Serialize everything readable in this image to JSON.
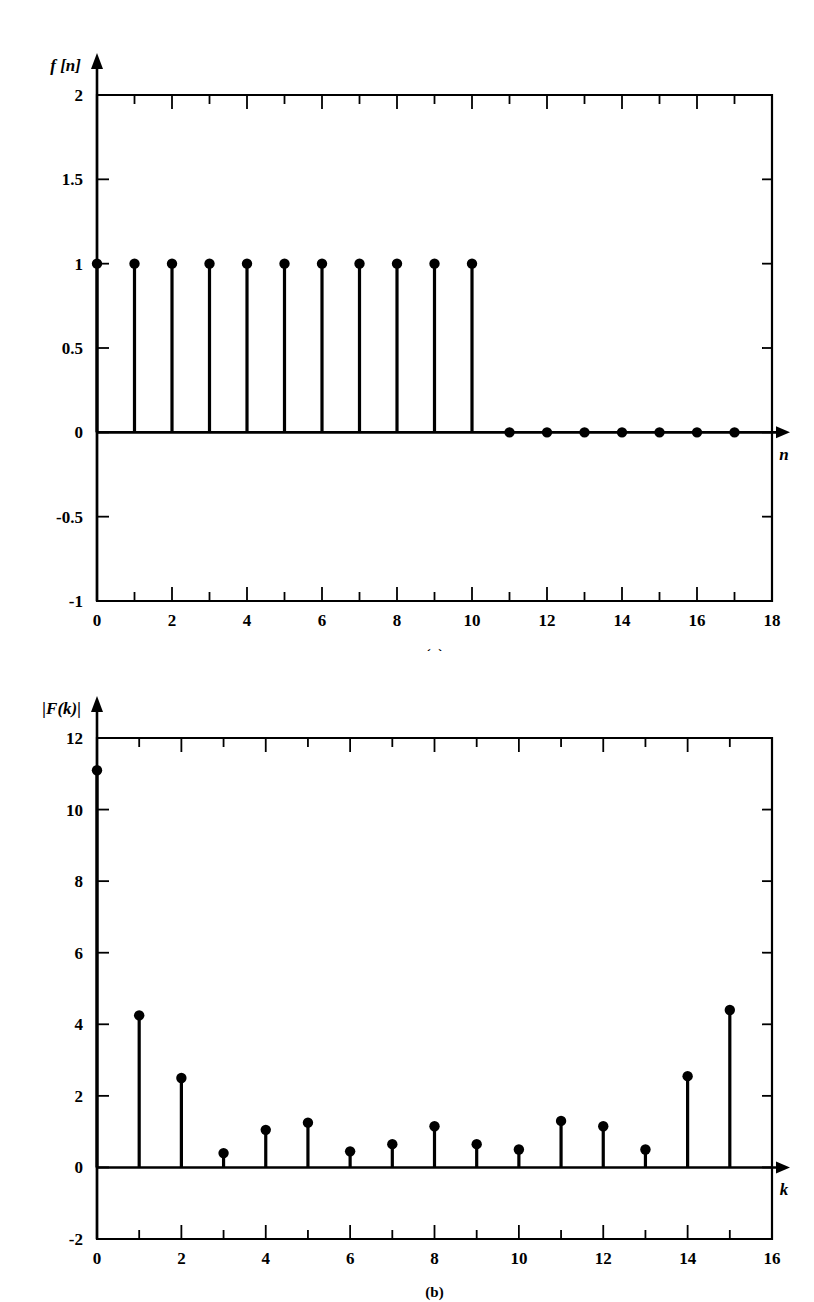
{
  "figure": {
    "background_color": "#ffffff",
    "ink_color": "#000000"
  },
  "panels": [
    {
      "id": "a",
      "caption": "(a)",
      "y_axis_label": "f [n]",
      "x_axis_label": "n"
    },
    {
      "id": "b",
      "caption": "(b)",
      "y_axis_label": "|F(k)|",
      "x_axis_label": "k"
    }
  ],
  "chart_data": [
    {
      "type": "scatter",
      "subtype": "stem",
      "panel": "a",
      "title": "",
      "xlabel": "n",
      "ylabel": "f [n]",
      "xlim": [
        0,
        18
      ],
      "ylim": [
        -1,
        2
      ],
      "grid": false,
      "legend": "none",
      "xticks": [
        0,
        2,
        4,
        6,
        8,
        10,
        12,
        14,
        16,
        18
      ],
      "xticklabels": [
        "0",
        "2",
        "4",
        "6",
        "8",
        "10",
        "12",
        "14",
        "16",
        "18"
      ],
      "xminorticks": [
        1,
        3,
        5,
        7,
        9,
        11,
        13,
        15,
        17
      ],
      "yticks": [
        -1,
        -0.5,
        0,
        0.5,
        1,
        1.5,
        2
      ],
      "yticklabels": [
        "-1",
        "-0.5",
        "0",
        "0.5",
        "1",
        "1.5",
        "2"
      ],
      "x": [
        0,
        1,
        2,
        3,
        4,
        5,
        6,
        7,
        8,
        9,
        10,
        11,
        12,
        13,
        14,
        15,
        16,
        17
      ],
      "values": [
        1,
        1,
        1,
        1,
        1,
        1,
        1,
        1,
        1,
        1,
        1,
        0,
        0,
        0,
        0,
        0,
        0,
        0
      ],
      "marker": "filled-circle",
      "baseline": 0
    },
    {
      "type": "scatter",
      "subtype": "stem",
      "panel": "b",
      "title": "",
      "xlabel": "k",
      "ylabel": "|F(k)|",
      "xlim": [
        0,
        16
      ],
      "ylim": [
        -2,
        12
      ],
      "grid": false,
      "legend": "none",
      "xticks": [
        0,
        2,
        4,
        6,
        8,
        10,
        12,
        14,
        16
      ],
      "xticklabels": [
        "0",
        "2",
        "4",
        "6",
        "8",
        "10",
        "12",
        "14",
        "16"
      ],
      "xminorticks": [
        1,
        3,
        5,
        7,
        9,
        11,
        13,
        15
      ],
      "yticks": [
        -2,
        0,
        2,
        4,
        6,
        8,
        10,
        12
      ],
      "yticklabels": [
        "-2",
        "0",
        "2",
        "4",
        "6",
        "8",
        "10",
        "12"
      ],
      "x": [
        0,
        1,
        2,
        3,
        4,
        5,
        6,
        7,
        8,
        9,
        10,
        11,
        12,
        13,
        14,
        15
      ],
      "values": [
        11.1,
        4.25,
        2.5,
        0.4,
        1.05,
        1.25,
        0.45,
        0.65,
        1.15,
        0.65,
        0.5,
        1.3,
        1.15,
        0.5,
        2.55,
        4.4
      ],
      "marker": "filled-circle",
      "baseline": 0
    }
  ]
}
